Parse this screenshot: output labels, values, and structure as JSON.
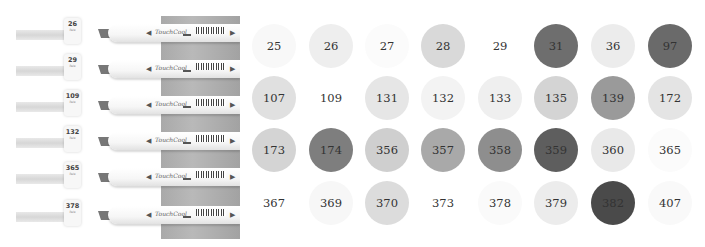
{
  "photo": {
    "brand_text": "TouchCool",
    "markers": [
      {
        "cap_number": "26",
        "cap_sub": "Pale",
        "top": 16
      },
      {
        "cap_number": "29",
        "cap_sub": "Pale",
        "top": 52
      },
      {
        "cap_number": "109",
        "cap_sub": "Pale",
        "top": 88
      },
      {
        "cap_number": "132",
        "cap_sub": "Pale",
        "top": 124
      },
      {
        "cap_number": "365",
        "cap_sub": "Pale",
        "top": 160
      },
      {
        "cap_number": "378",
        "cap_sub": "Pale",
        "top": 198
      }
    ],
    "arrow_left": "◀",
    "arrow_right": "▶"
  },
  "swatches": [
    {
      "label": "25",
      "color": "#f8f8f8"
    },
    {
      "label": "26",
      "color": "#eeeeee"
    },
    {
      "label": "27",
      "color": "#fbfbfb"
    },
    {
      "label": "28",
      "color": "#d9d9d9"
    },
    {
      "label": "29",
      "color": "#ffffff"
    },
    {
      "label": "31",
      "color": "#6e6e6e"
    },
    {
      "label": "36",
      "color": "#ececec"
    },
    {
      "label": "97",
      "color": "#6a6a6a"
    },
    {
      "label": "107",
      "color": "#e0e0e0"
    },
    {
      "label": "109",
      "color": "#ffffff"
    },
    {
      "label": "131",
      "color": "#e6e6e6"
    },
    {
      "label": "132",
      "color": "#f3f3f3"
    },
    {
      "label": "133",
      "color": "#efefef"
    },
    {
      "label": "135",
      "color": "#d4d4d4"
    },
    {
      "label": "139",
      "color": "#9a9a9a"
    },
    {
      "label": "172",
      "color": "#e4e4e4"
    },
    {
      "label": "173",
      "color": "#d4d4d4"
    },
    {
      "label": "174",
      "color": "#7e7e7e"
    },
    {
      "label": "356",
      "color": "#cfcfcf"
    },
    {
      "label": "357",
      "color": "#a9a9a9"
    },
    {
      "label": "358",
      "color": "#8e8e8e"
    },
    {
      "label": "359",
      "color": "#5e5e5e"
    },
    {
      "label": "360",
      "color": "#e9e9e9"
    },
    {
      "label": "365",
      "color": "#fbfbfb"
    },
    {
      "label": "367",
      "color": "#ffffff"
    },
    {
      "label": "369",
      "color": "#f7f7f7"
    },
    {
      "label": "370",
      "color": "#dcdcdc"
    },
    {
      "label": "373",
      "color": "#ffffff"
    },
    {
      "label": "378",
      "color": "#fafafa"
    },
    {
      "label": "379",
      "color": "#ececec"
    },
    {
      "label": "382",
      "color": "#4a4a4a"
    },
    {
      "label": "407",
      "color": "#f9f9f9"
    }
  ]
}
